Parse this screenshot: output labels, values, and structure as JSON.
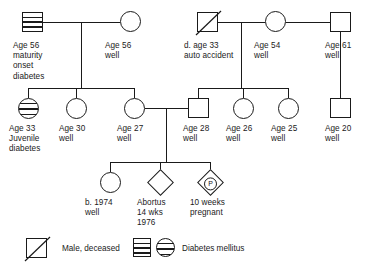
{
  "figure": {
    "type": "pedigree-chart",
    "title": "",
    "line_color": "#1a1a1a",
    "background": "#ffffff"
  },
  "generations": {
    "g1": {
      "couple_left": {
        "father": {
          "id": "g1-male-1",
          "shape": "square",
          "fill": "hatched",
          "meaning": "diabetes-mellitus",
          "label": "Age 56\nmaturity\nonset\ndiabetes"
        },
        "mother": {
          "id": "g1-female-1",
          "shape": "circle",
          "fill": "none",
          "label": "Age 56\nwell"
        }
      },
      "couple_right": {
        "father": {
          "id": "g1-male-2",
          "shape": "square",
          "fill": "none",
          "meaning": "male-deceased",
          "deceased": true,
          "label": "d. age 33\nauto accident"
        },
        "mother": {
          "id": "g1-female-2",
          "shape": "circle",
          "fill": "none",
          "label": "Age 54\nwell"
        }
      },
      "second_mate": {
        "id": "g1-male-3",
        "shape": "square",
        "fill": "none",
        "label": "Age 61\nwell"
      }
    },
    "g2": [
      {
        "id": "g2-child-1",
        "shape": "circle",
        "fill": "hatched",
        "meaning": "diabetes-mellitus",
        "label": "Age 33\nJuvenile\ndiabetes"
      },
      {
        "id": "g2-child-2",
        "shape": "circle",
        "fill": "none",
        "label": "Age 30\nwell"
      },
      {
        "id": "g2-child-3",
        "shape": "circle",
        "fill": "none",
        "label": "Age 27\nwell"
      },
      {
        "id": "g2-child-4",
        "shape": "square",
        "fill": "none",
        "label": "Age 28\nwell"
      },
      {
        "id": "g2-child-5",
        "shape": "circle",
        "fill": "none",
        "label": "Age 26\nwell"
      },
      {
        "id": "g2-child-6",
        "shape": "circle",
        "fill": "none",
        "label": "Age 25\nwell"
      },
      {
        "id": "g2-child-7",
        "shape": "square",
        "fill": "none",
        "label": "Age 20\nwell"
      }
    ],
    "g3": [
      {
        "id": "g3-child-1",
        "shape": "circle",
        "fill": "none",
        "label": "b. 1974\nwell"
      },
      {
        "id": "g3-child-2",
        "shape": "diamond",
        "fill": "none",
        "meaning": "abortus",
        "label": "Abortus\n14 wks\n1976"
      },
      {
        "id": "g3-child-3",
        "shape": "diamond",
        "fill": "none",
        "marker": "P",
        "meaning": "pregnancy",
        "label": "10 weeks\npregnant"
      }
    ]
  },
  "legend": {
    "items": [
      {
        "id": "legend-male-deceased",
        "symbol": "square-with-slash",
        "label": "Male, deceased"
      },
      {
        "id": "legend-diabetes",
        "symbol": "hatched-square-and-circle",
        "label": "Diabetes mellitus"
      }
    ]
  }
}
